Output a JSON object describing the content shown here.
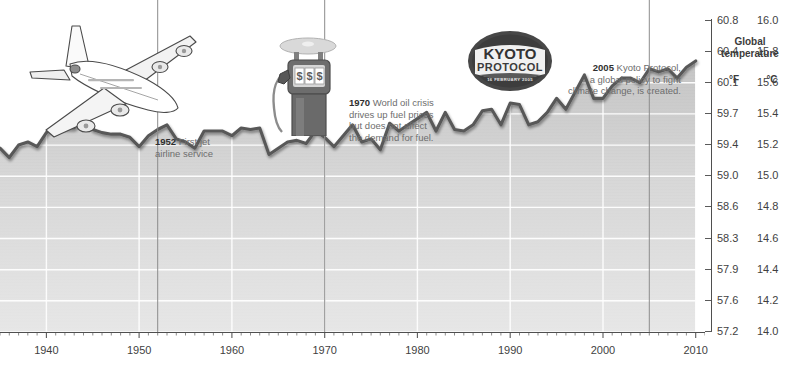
{
  "chart_data": {
    "type": "area",
    "title": "Global temperature",
    "xlabel": "",
    "ylabel": "Global temperature",
    "grid": true,
    "legend_position": "none",
    "xlim": [
      1935,
      2011
    ],
    "ylim_f": [
      57.2,
      60.95
    ],
    "ylim_c": [
      14.0,
      16.08
    ],
    "x_tick_labels": [
      "1940",
      "1950",
      "1960",
      "1970",
      "1980",
      "1990",
      "2000",
      "2010"
    ],
    "x_ticks": [
      1940,
      1950,
      1960,
      1970,
      1980,
      1990,
      2000,
      2010
    ],
    "y_axis_f_label": "°F",
    "y_axis_c_label": "°C",
    "y_ticks_f": [
      "60.8",
      "60.4",
      "60.1",
      "59.7",
      "59.4",
      "59.0",
      "58.6",
      "58.3",
      "57.9",
      "57.6",
      "57.2"
    ],
    "y_ticks_c": [
      "16.0",
      "15.8",
      "15.6",
      "15.4",
      "15.2",
      "15.0",
      "14.8",
      "14.6",
      "14.4",
      "14.2",
      "14.0"
    ],
    "series": [
      {
        "name": "Global mean temperature",
        "unit": "°C",
        "x": [
          1935,
          1936,
          1937,
          1938,
          1939,
          1940,
          1941,
          1942,
          1943,
          1944,
          1945,
          1946,
          1947,
          1948,
          1949,
          1950,
          1951,
          1952,
          1953,
          1954,
          1955,
          1956,
          1957,
          1958,
          1959,
          1960,
          1961,
          1962,
          1963,
          1964,
          1965,
          1966,
          1967,
          1968,
          1969,
          1970,
          1971,
          1972,
          1973,
          1974,
          1975,
          1976,
          1977,
          1978,
          1979,
          1980,
          1981,
          1982,
          1983,
          1984,
          1985,
          1986,
          1987,
          1988,
          1989,
          1990,
          1991,
          1992,
          1993,
          1994,
          1995,
          1996,
          1997,
          1998,
          1999,
          2000,
          2001,
          2002,
          2003,
          2004,
          2005,
          2006,
          2007,
          2008,
          2009,
          2010
        ],
        "values": [
          15.18,
          15.12,
          15.2,
          15.22,
          15.19,
          15.28,
          15.32,
          15.31,
          15.31,
          15.39,
          15.3,
          15.28,
          15.27,
          15.27,
          15.25,
          15.19,
          15.26,
          15.3,
          15.33,
          15.24,
          15.22,
          15.18,
          15.29,
          15.29,
          15.29,
          15.26,
          15.31,
          15.3,
          15.31,
          15.14,
          15.18,
          15.22,
          15.23,
          15.21,
          15.29,
          15.25,
          15.19,
          15.26,
          15.33,
          15.22,
          15.24,
          15.17,
          15.34,
          15.29,
          15.33,
          15.37,
          15.41,
          15.29,
          15.41,
          15.3,
          15.29,
          15.33,
          15.42,
          15.43,
          15.33,
          15.47,
          15.46,
          15.33,
          15.35,
          15.41,
          15.5,
          15.43,
          15.54,
          15.65,
          15.5,
          15.5,
          15.58,
          15.63,
          15.63,
          15.6,
          15.69,
          15.67,
          15.69,
          15.63,
          15.7,
          15.74
        ]
      }
    ]
  },
  "axis_panel": {
    "title_line1": "Global",
    "title_line2": "temperature",
    "unit_f": "°F",
    "unit_c": "°C",
    "ticks": [
      {
        "f": "60.8",
        "c": "16.0"
      },
      {
        "f": "60.4",
        "c": "15.8"
      },
      {
        "f": "60.1",
        "c": "15.6"
      },
      {
        "f": "59.7",
        "c": "15.4"
      },
      {
        "f": "59.4",
        "c": "15.2"
      },
      {
        "f": "59.0",
        "c": "15.0"
      },
      {
        "f": "58.6",
        "c": "14.8"
      },
      {
        "f": "58.3",
        "c": "14.6"
      },
      {
        "f": "57.9",
        "c": "14.4"
      },
      {
        "f": "57.6",
        "c": "14.2"
      },
      {
        "f": "57.2",
        "c": "14.0"
      }
    ]
  },
  "x_axis": {
    "labels": [
      "1940",
      "1950",
      "1960",
      "1970",
      "1980",
      "1990",
      "2000",
      "2010"
    ]
  },
  "annotations": [
    {
      "id": "jet-1952",
      "year": "1952",
      "text": "First jet airline service",
      "line1": "First jet",
      "line2": "airline service",
      "icon": "airliner-illustration"
    },
    {
      "id": "oil-crisis-1970",
      "year": "1970",
      "text": "World oil crisis drives up fuel prices but does not affect the demand for fuel.",
      "line1": "World oil crisis",
      "line2": "drives up fuel prices",
      "line3": "but does not affect",
      "line4": "the demand for fuel.",
      "icon": "fuel-pump-illustration"
    },
    {
      "id": "kyoto-2005",
      "year": "2005",
      "text": "Kyoto Protocol, a global policy to fight climate change, is created.",
      "line1": "Kyoto Protocol,",
      "line2": "a global policy to fight",
      "line3": "climate change, is created.",
      "icon": "kyoto-stamp"
    }
  ],
  "stamp": {
    "line1": "KYOTO",
    "line2": "PROTOCOL",
    "date": "16 FEBRUARY 2005"
  },
  "colors": {
    "line": "#565656",
    "fill_top": "#c9c9c9",
    "fill_bottom": "#e3e3e3",
    "grid": "#ffffff",
    "text": "#4a4a4a",
    "heading": "#2f2f2f",
    "marker_line": "#9a9a9a",
    "stamp": "#3a3a3a"
  }
}
